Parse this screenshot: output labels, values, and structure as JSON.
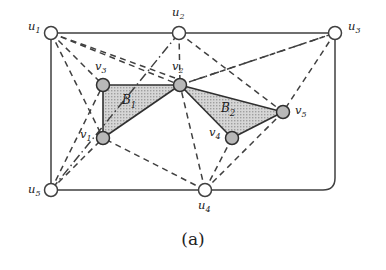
{
  "figure": {
    "caption": "(a)",
    "colors": {
      "stroke": "#404040",
      "node_outer_fill": "#ffffff",
      "node_inner_fill": "#b8b8b8",
      "region_fill": "#c9c9c9",
      "text": "#1a1a1a",
      "background": "#ffffff"
    }
  },
  "outer_nodes": [
    {
      "id": "u1",
      "label_base": "u",
      "label_sub": "1",
      "cx": 51,
      "cy": 33,
      "r": 6.5,
      "label_x": 28,
      "label_y": 30
    },
    {
      "id": "u2",
      "label_base": "u",
      "label_sub": "2",
      "cx": 179,
      "cy": 33,
      "r": 6.5,
      "label_x": 172,
      "label_y": 16
    },
    {
      "id": "u3",
      "label_base": "u",
      "label_sub": "3",
      "cx": 335,
      "cy": 33,
      "r": 6.5,
      "label_x": 348,
      "label_y": 30
    },
    {
      "id": "u4",
      "label_base": "u",
      "label_sub": "4",
      "cx": 205,
      "cy": 190,
      "r": 6.5,
      "label_x": 198,
      "label_y": 209
    },
    {
      "id": "u5",
      "label_base": "u",
      "label_sub": "5",
      "cx": 51,
      "cy": 190,
      "r": 6.5,
      "label_x": 28,
      "label_y": 193
    }
  ],
  "inner_nodes": [
    {
      "id": "v1",
      "label_base": "v",
      "label_sub": "1",
      "cx": 103,
      "cy": 138,
      "r": 6.5,
      "label_x": 80,
      "label_y": 138
    },
    {
      "id": "v2",
      "label_base": "v",
      "label_sub": "2",
      "cx": 180,
      "cy": 85,
      "r": 6.5,
      "label_x": 172,
      "label_y": 70
    },
    {
      "id": "v3",
      "label_base": "v",
      "label_sub": "3",
      "cx": 103,
      "cy": 85,
      "r": 6.5,
      "label_x": 95,
      "label_y": 70
    },
    {
      "id": "v4",
      "label_base": "v",
      "label_sub": "4",
      "cx": 232,
      "cy": 138,
      "r": 6.5,
      "label_x": 209,
      "label_y": 136
    },
    {
      "id": "v5",
      "label_base": "v",
      "label_sub": "5",
      "cx": 283,
      "cy": 112,
      "r": 6.5,
      "label_x": 295,
      "label_y": 114
    }
  ],
  "regions": [
    {
      "id": "B1",
      "label_base": "B",
      "label_sub": "1",
      "points": "103,85 180,85 103,138",
      "label_x": 122,
      "label_y": 104
    },
    {
      "id": "B2",
      "label_base": "B",
      "label_sub": "2",
      "points": "180,85 283,112 232,138",
      "label_x": 221,
      "label_y": 112
    }
  ],
  "outer_cycle_path": "M 51,33 L 179,33 L 335,33 L 335,178 Q 335,190 323,190 L 205,190 L 51,190 L 51,33",
  "solid_region_edges": [
    {
      "from": "v3",
      "to": "v2",
      "x1": 103,
      "y1": 85,
      "x2": 180,
      "y2": 85
    },
    {
      "from": "v3",
      "to": "v1",
      "x1": 103,
      "y1": 85,
      "x2": 103,
      "y2": 138
    },
    {
      "from": "v1",
      "to": "v2",
      "x1": 103,
      "y1": 138,
      "x2": 180,
      "y2": 85
    },
    {
      "from": "v2",
      "to": "v5",
      "x1": 180,
      "y1": 85,
      "x2": 283,
      "y2": 112
    },
    {
      "from": "v2",
      "to": "v4",
      "x1": 180,
      "y1": 85,
      "x2": 232,
      "y2": 138
    },
    {
      "from": "v4",
      "to": "v5",
      "x1": 232,
      "y1": 138,
      "x2": 283,
      "y2": 112
    }
  ],
  "dashed_edges": [
    {
      "from": "u1",
      "to": "v3",
      "x1": 51,
      "y1": 33,
      "x2": 103,
      "y2": 85
    },
    {
      "from": "u1",
      "to": "v2",
      "x1": 51,
      "y1": 33,
      "x2": 180,
      "y2": 85
    },
    {
      "from": "u1",
      "to": "v1",
      "x1": 51,
      "y1": 33,
      "x2": 103,
      "y2": 138
    },
    {
      "from": "u1",
      "to": "v2_upper",
      "x1": 51,
      "y1": 33,
      "x2": 175,
      "y2": 78
    },
    {
      "from": "u2",
      "to": "v2",
      "x1": 179,
      "y1": 33,
      "x2": 180,
      "y2": 85
    },
    {
      "from": "u2",
      "to": "v5",
      "x1": 179,
      "y1": 33,
      "x2": 283,
      "y2": 112
    },
    {
      "from": "u3",
      "to": "v2",
      "x1": 335,
      "y1": 33,
      "x2": 180,
      "y2": 85
    },
    {
      "from": "u3",
      "to": "v5",
      "x1": 335,
      "y1": 33,
      "x2": 283,
      "y2": 112
    },
    {
      "from": "u4",
      "to": "v1",
      "x1": 205,
      "y1": 190,
      "x2": 103,
      "y2": 138
    },
    {
      "from": "u4",
      "to": "v2",
      "x1": 205,
      "y1": 190,
      "x2": 180,
      "y2": 85
    },
    {
      "from": "u4",
      "to": "v4",
      "x1": 205,
      "y1": 190,
      "x2": 232,
      "y2": 138
    },
    {
      "from": "u4",
      "to": "v5",
      "x1": 205,
      "y1": 190,
      "x2": 283,
      "y2": 112
    },
    {
      "from": "u5",
      "to": "v1",
      "x1": 51,
      "y1": 190,
      "x2": 103,
      "y2": 138
    },
    {
      "from": "u5",
      "to": "v3",
      "x1": 51,
      "y1": 190,
      "x2": 103,
      "y2": 85
    }
  ],
  "dashdot_edges": [
    {
      "from": "u2",
      "to": "u5_via_v3",
      "x1": 179,
      "y1": 33,
      "x2": 51,
      "y2": 190
    },
    {
      "from": "u3",
      "to": "v2",
      "x1": 335,
      "y1": 33,
      "x2": 180,
      "y2": 85
    }
  ]
}
